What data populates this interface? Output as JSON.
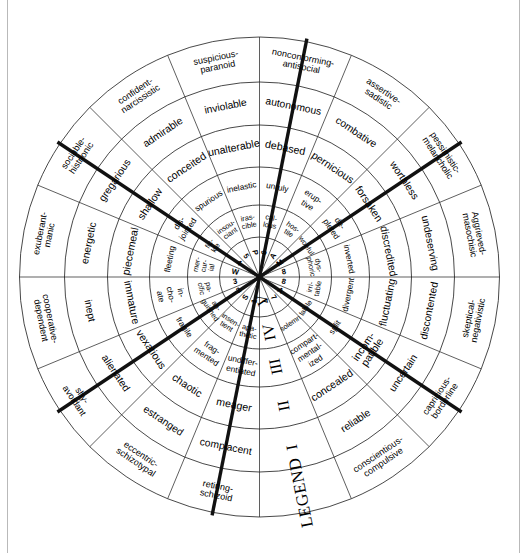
{
  "diagram": {
    "type": "radial-circumplex",
    "legend": {
      "word": "LEGEND",
      "levels": [
        "I",
        "II",
        "III",
        "IV",
        "V"
      ]
    },
    "colors": {
      "line": "#1a1a1a",
      "divider": "#111111",
      "background": "#ffffff",
      "frame": "#b9b9b9"
    },
    "rings": {
      "outer_label": "I",
      "r4_label": "II",
      "r3_label": "III",
      "r2_label": "IV",
      "core_label": "V"
    },
    "sectors": [
      {
        "outer": "retiring-\nschizoid",
        "r4": "complacent",
        "r3": "meager",
        "r2": "undiffer-\nentiated",
        "r1": "apa-\nthetic",
        "core": "1"
      },
      {
        "outer": "eccentric-\nschizotypal",
        "r4": "estranged",
        "r3": "chaotic",
        "r2": "frag-\nmented",
        "r1": "insen-\ntient",
        "core": "S"
      },
      {
        "outer": "shy-\navoidant",
        "r4": "alienated",
        "r3": "vexatious",
        "r2": "fragile",
        "r1": "an-\nguished",
        "core": "2"
      },
      {
        "outer": "cooperative-\ndependent",
        "r4": "inept",
        "r3": "immature",
        "r2": "in-\ncho-\nate",
        "r1": "pa-\ncific",
        "core": "3"
      },
      {
        "outer": "exuberant-\nmanic",
        "r4": "energetic",
        "r3": "piecemeal",
        "r2": "fleeting",
        "r1": "mer-\ncur-\nial",
        "core": "W"
      },
      {
        "outer": "sociable-\nhistrionic",
        "r4": "gregarious",
        "r3": "shallow",
        "r2": "dis-\njointed",
        "r1": "fic-\nkle",
        "core": "4"
      },
      {
        "outer": "confident-\nnarcissistic",
        "r4": "admirable",
        "r3": "conceited",
        "r2": "spurious",
        "r1": "insou-\nciant",
        "core": "5"
      },
      {
        "outer": "suspicious-\nparanoid",
        "r4": "inviolable",
        "r3": "unalterable",
        "r2": "inelastic",
        "r1": "iras-\ncible",
        "core": "P"
      },
      {
        "outer": "nonconforming-\nantisocial",
        "r4": "autonomous",
        "r3": "debased",
        "r2": "unruly",
        "r1": "cal-\nlous",
        "core": "6"
      },
      {
        "outer": "assertive-\nsadistic",
        "r4": "combative",
        "r3": "pernicious",
        "r2": "erup-\ntive",
        "r1": "hos-\ntile",
        "core": "A"
      },
      {
        "outer": "pessimistic-\nmelancholic",
        "r4": "worthless",
        "r3": "forsaken",
        "r2": "de-\npleted",
        "r1": "woeful",
        "core": "M"
      },
      {
        "outer": "Aggrieved-\nmasochisic",
        "r4": "undeserving",
        "r3": "discredited",
        "r2": "inverted",
        "r1": "dys-\nphoric",
        "core": "8"
      },
      {
        "outer": "skeptical-\nnegativistic",
        "r4": "discontented",
        "r3": "fluctuating",
        "r2": "divergent",
        "r1": "irri-\ntable",
        "core": "8"
      },
      {
        "outer": "capricious-\nborderline",
        "r4": "uncertain",
        "r3": "incom-\npatible",
        "r2": "split",
        "r1": "labile",
        "core": "A"
      },
      {
        "outer": "conscientious-\ncompulsive",
        "r4": "reliable",
        "r3": "concealed",
        "r2": "compart-\nmental-\nized",
        "r1": "solemn",
        "core": "7"
      },
      {
        "outer": "",
        "r4": "",
        "r3": "",
        "r2": "",
        "r1": "",
        "core": "7"
      }
    ]
  }
}
